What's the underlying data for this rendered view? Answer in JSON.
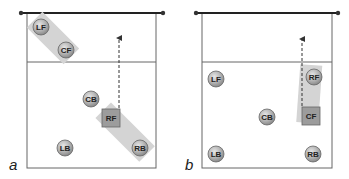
{
  "diagram": {
    "type": "volleyball-rotation",
    "colors": {
      "court_line": "#555555",
      "net": "#222222",
      "player_fill": "#b0b0b0",
      "player_stroke": "#666666",
      "highlight": "#d6d6d6",
      "setter_square": "#9a9a9a",
      "arrow": "#333333"
    },
    "panels": [
      {
        "label": "a",
        "players": {
          "LF": "LF",
          "CF": "CF",
          "CB": "CB",
          "RF": "RF",
          "LB": "LB",
          "RB": "RB"
        },
        "setter": "RF",
        "highlighted_pairs": [
          [
            "LF",
            "CF"
          ],
          [
            "RF",
            "RB"
          ]
        ]
      },
      {
        "label": "b",
        "players": {
          "LF": "LF",
          "RF": "RF",
          "CB": "CB",
          "CF": "CF",
          "LB": "LB",
          "RB": "RB"
        },
        "setter": "CF",
        "highlighted_pairs": [
          [
            "RF",
            "CF"
          ]
        ]
      }
    ]
  }
}
